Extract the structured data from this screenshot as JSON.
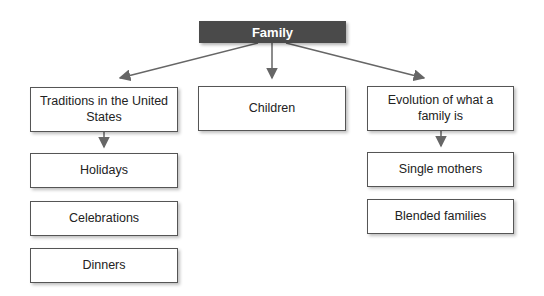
{
  "root": {
    "label": "Family"
  },
  "branches": [
    {
      "label": "Traditions in the United States",
      "children": [
        "Holidays",
        "Celebrations",
        "Dinners"
      ]
    },
    {
      "label": "Children",
      "children": []
    },
    {
      "label": "Evolution of what a family is",
      "children": [
        "Single mothers",
        "Blended families"
      ]
    }
  ],
  "colors": {
    "root_fill": "#4a4a4a",
    "line": "#666666",
    "border": "#555555"
  }
}
